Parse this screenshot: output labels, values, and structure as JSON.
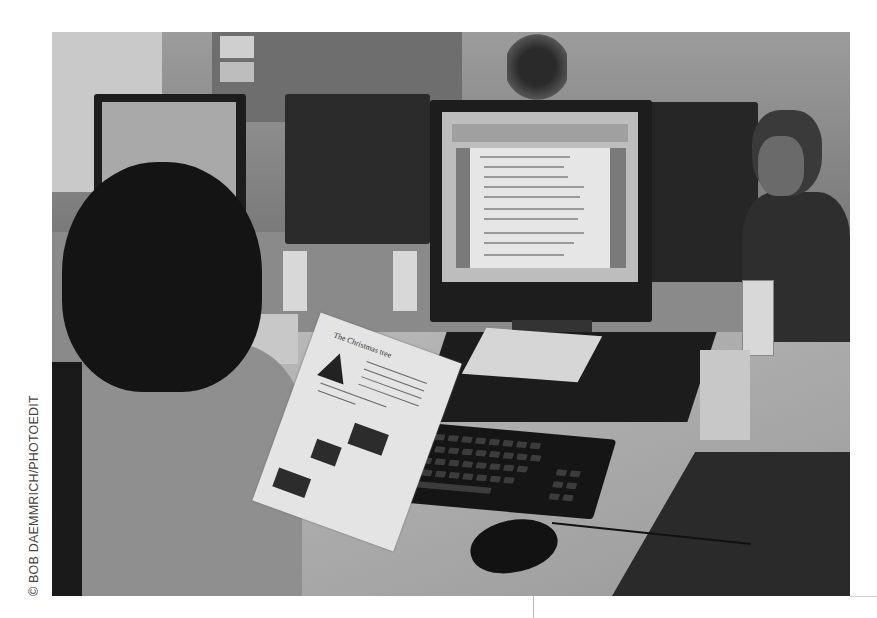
{
  "image": {
    "type": "photograph",
    "description": "Students working at desktop computers in a classroom computer lab",
    "tone": "grayscale"
  },
  "credit": {
    "text": "© BOB DAEMMRICH/PHOTOEDIT",
    "orientation": "vertical"
  },
  "scene": {
    "main_monitor": {
      "content": "word processor document with numbered list",
      "toolbar": "word processor toolbar"
    },
    "left_monitor": {
      "content": "web page"
    },
    "paper_handout": {
      "title": "The Christmas tree"
    },
    "keyboard": {
      "brand": "DELL"
    },
    "signs": [
      "computer-lab sign",
      "computer-lab sign",
      "computer-lab sign"
    ],
    "people": [
      "student in foreground (back of head)",
      "student at right covering mouth"
    ]
  },
  "colors": {
    "background": "#ffffff",
    "photo_mid": "#8a8a8a",
    "dark": "#1d1d1d",
    "credit_text": "#444444"
  }
}
